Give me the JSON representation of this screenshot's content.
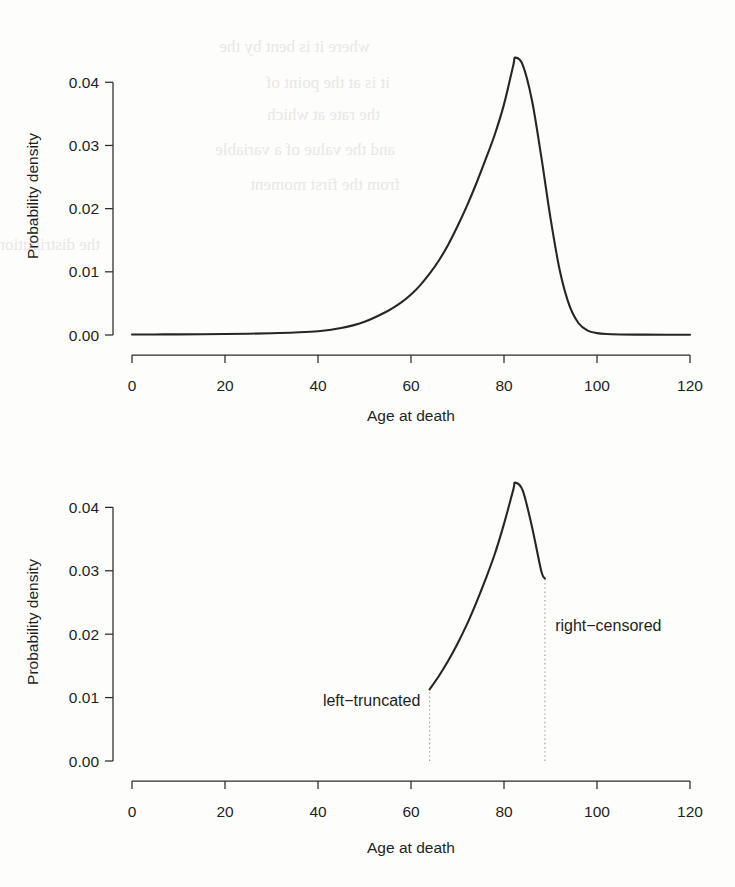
{
  "figure": {
    "background_color": "#ffffff",
    "ink_color": "#262626",
    "marker_color": "#9a9a9a"
  },
  "chart_data": [
    {
      "id": "panel-top",
      "type": "line",
      "title": "",
      "xlabel": "Age at death",
      "ylabel": "Probability density",
      "xlim": [
        0,
        120
      ],
      "ylim": [
        0,
        0.044
      ],
      "xticks": [
        0,
        20,
        40,
        60,
        80,
        100,
        120
      ],
      "xticklabels": [
        "0",
        "20",
        "40",
        "60",
        "80",
        "100",
        "120"
      ],
      "yticks": [
        0.0,
        0.01,
        0.02,
        0.03,
        0.04
      ],
      "yticklabels": [
        "0.00",
        "0.01",
        "0.02",
        "0.03",
        "0.04"
      ],
      "grid": false,
      "legend": "none",
      "series": [
        {
          "name": "full density",
          "x": [
            0,
            5,
            10,
            15,
            20,
            25,
            30,
            35,
            40,
            45,
            50,
            55,
            58,
            60,
            62,
            64,
            66,
            68,
            70,
            72,
            74,
            76,
            78,
            80,
            82,
            82.4,
            84,
            86,
            88,
            90,
            92,
            94,
            96,
            98,
            100,
            102,
            105,
            110,
            115,
            120
          ],
          "y": [
            8e-05,
            9e-05,
            0.0001,
            0.00012,
            0.00015,
            0.0002,
            0.00028,
            0.0004,
            0.0006,
            0.0011,
            0.0021,
            0.0038,
            0.0052,
            0.0064,
            0.0079,
            0.0097,
            0.0118,
            0.0143,
            0.0172,
            0.0204,
            0.0239,
            0.0277,
            0.0317,
            0.0365,
            0.0427,
            0.0439,
            0.0428,
            0.0372,
            0.0283,
            0.0185,
            0.0102,
            0.0048,
            0.0019,
            0.0007,
            0.0003,
            0.00015,
            9e-05,
            6e-05,
            5e-05,
            5e-05
          ]
        }
      ]
    },
    {
      "id": "panel-bottom",
      "type": "line",
      "title": "",
      "xlabel": "Age at death",
      "ylabel": "Probability density",
      "xlim": [
        0,
        120
      ],
      "ylim": [
        0,
        0.044
      ],
      "xticks": [
        0,
        20,
        40,
        60,
        80,
        100,
        120
      ],
      "xticklabels": [
        "0",
        "20",
        "40",
        "60",
        "80",
        "100",
        "120"
      ],
      "yticks": [
        0.0,
        0.01,
        0.02,
        0.03,
        0.04
      ],
      "yticklabels": [
        "0.00",
        "0.01",
        "0.02",
        "0.03",
        "0.04"
      ],
      "grid": false,
      "legend": "none",
      "series": [
        {
          "name": "observed window density",
          "x": [
            64,
            66,
            68,
            70,
            72,
            74,
            76,
            78,
            80,
            82,
            82.4,
            84,
            86,
            88,
            88.8
          ],
          "y": [
            0.0113,
            0.0134,
            0.0158,
            0.0185,
            0.0215,
            0.0249,
            0.0286,
            0.0326,
            0.0374,
            0.0428,
            0.0439,
            0.0427,
            0.037,
            0.03,
            0.0288
          ]
        }
      ],
      "annotations": [
        {
          "name": "left-truncated",
          "label": "left−truncated",
          "x": 64,
          "marker_y_range": [
            0,
            0.0113
          ],
          "label_anchor": "end",
          "label_x": 62,
          "label_y": 0.0086
        },
        {
          "name": "right-censored",
          "label": "right−censored",
          "x": 88.8,
          "marker_y_range": [
            0,
            0.0288
          ],
          "label_anchor": "start",
          "label_x": 91,
          "label_y": 0.0205
        }
      ]
    }
  ],
  "ghost_text": {
    "note": "faint show-through text from reverse page of scan",
    "lines": [
      "where it is bent by the",
      "it is at the point of",
      "the rate at which",
      "and the value of a variable",
      "from the first moment",
      "the distribution"
    ]
  }
}
